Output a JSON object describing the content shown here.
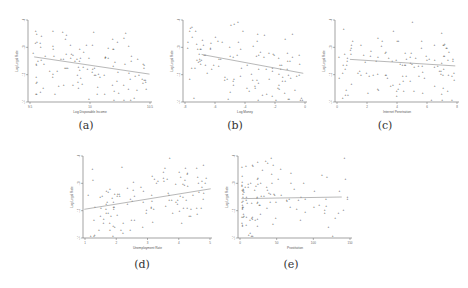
{
  "chart_data": [
    {
      "type": "scatter",
      "caption": "(a)",
      "xlabel": "Log Disposable Income",
      "ylabel": "Log Legal Rate",
      "xticks": [
        "9.5",
        "10",
        "10.5"
      ],
      "yticks": [
        "-14",
        "-12",
        "-10",
        "-8"
      ],
      "trend": "negative",
      "fit_line": {
        "x0": 0.05,
        "y0": 0.55,
        "x1": 0.98,
        "y1": 0.34
      }
    },
    {
      "type": "scatter",
      "caption": "(b)",
      "xlabel": "Log Money",
      "ylabel": "Log Legal Rate",
      "xticks": [
        "-8",
        "-6",
        "-4",
        "-2",
        "0"
      ],
      "yticks": [
        "-14",
        "-12",
        "-10",
        "-8"
      ],
      "trend": "negative",
      "fit_line": {
        "x0": 0.15,
        "y0": 0.58,
        "x1": 0.97,
        "y1": 0.35
      }
    },
    {
      "type": "scatter",
      "caption": "(c)",
      "xlabel": "Internet Penetration",
      "ylabel": "Log Legal Rate",
      "xticks": [
        "0",
        "2",
        "4",
        "6",
        "8"
      ],
      "yticks": [
        "-14",
        "-12",
        "-10",
        "-8"
      ],
      "trend": "flat slightly negative",
      "fit_line": {
        "x0": 0.12,
        "y0": 0.52,
        "x1": 0.97,
        "y1": 0.44
      }
    },
    {
      "type": "scatter",
      "caption": "(d)",
      "xlabel": "Unemployment Rate",
      "ylabel": "Log Legal Rate",
      "xticks": [
        "1",
        "2",
        "3",
        "4",
        "5"
      ],
      "yticks": [
        "-14",
        "-12",
        "-10",
        "-8"
      ],
      "trend": "positive",
      "fit_line": {
        "x0": 0.01,
        "y0": 0.35,
        "x1": 0.99,
        "y1": 0.6
      }
    },
    {
      "type": "scatter",
      "caption": "(e)",
      "xlabel": "Prostitution",
      "ylabel": "Log Legal Rate",
      "xticks": [
        "0",
        "50",
        "100",
        "150"
      ],
      "yticks": [
        "-14",
        "-12",
        "-10",
        "-8"
      ],
      "trend": "flat",
      "fit_line": {
        "x0": 0.03,
        "y0": 0.48,
        "x1": 0.91,
        "y1": 0.5
      }
    }
  ]
}
